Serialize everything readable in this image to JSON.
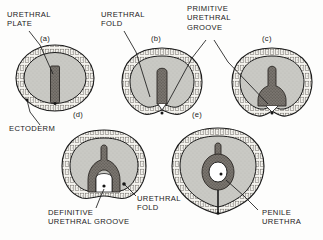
{
  "figure": {
    "background_color": "#fdfdfc",
    "ink_color": "#1b1b1b",
    "mesenchyme_fill": "#c9c9c4",
    "ectoderm_fill": "#f2f1ec",
    "urethral_plate_fill": "#6e6a66",
    "lumen_fill": "#ffffff"
  },
  "labels": {
    "urethral_plate": "URETHRAL\nPLATE",
    "urethral_fold_top": "URETHRAL\nFOLD",
    "primitive_urethral_groove": "PRIMITIVE\nURETHRAL\nGROOVE",
    "ectoderm": "ECTODERM",
    "definitive_urethral_groove": "DEFINITIVE\nURETHRAL GROOVE",
    "urethral_fold_bottom": "URETHRAL\nFOLD",
    "penile_urethra": "PENILE\nURETHRA"
  },
  "panels": [
    {
      "id": "a",
      "letter": "(a)",
      "stage": "urethral plate solid",
      "cx": 55,
      "cy": 78
    },
    {
      "id": "b",
      "letter": "(b)",
      "stage": "urethral folds form, primitive groove",
      "cx": 162,
      "cy": 82
    },
    {
      "id": "c",
      "letter": "(c)",
      "stage": "groove deepens",
      "cx": 272,
      "cy": 82
    },
    {
      "id": "d",
      "letter": "(d)",
      "stage": "definitive urethral groove open",
      "cx": 104,
      "cy": 172
    },
    {
      "id": "e",
      "letter": "(e)",
      "stage": "penile urethra tubularized",
      "cx": 218,
      "cy": 172
    }
  ]
}
